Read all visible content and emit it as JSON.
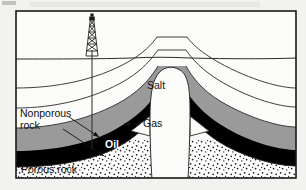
{
  "figure": {
    "kind": "geological-cross-section",
    "frame": {
      "border_color": "#1a1a1a",
      "background_color": "#fbfbf9",
      "page_color": "#f2f2f0"
    }
  },
  "palette": {
    "nonporous_light": "#fbfbf9",
    "nonporous_gray": "#9a9a9a",
    "oil_black": "#000000",
    "porous_stipple_base": "#ffffff",
    "stipple_dot": "#1a1a1a",
    "salt_fill": "#fbfbf9",
    "line": "#2a2a2a",
    "text": "#111111",
    "text_on_dark": "#ffffff"
  },
  "labels": {
    "salt": "Salt",
    "gas": "Gas",
    "oil": "Oil",
    "nonporous_line1": "Nonporous",
    "nonporous_line2": "rock",
    "porous": "Porous rock"
  },
  "features": {
    "derrick": "oil-derrick",
    "wellbore": "well-bore-line",
    "ground_surface": "ground-surface-line",
    "salt_dome": "salt-dome-column",
    "gas_cap_left": "gas-wedge-left",
    "gas_cap_right": "gas-wedge-right",
    "oil_band_left": "oil-band-left",
    "oil_band_right": "oil-band-right"
  },
  "artifacts": {
    "top_ghost_text": "",
    "has_scan_noise": true
  }
}
